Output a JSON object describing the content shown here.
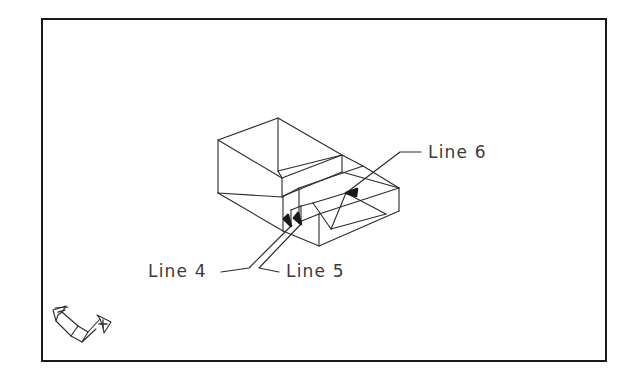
{
  "figure": {
    "background_color": "#ffffff",
    "line_color": "#2b2b2b",
    "text_color": "#3a3a3a",
    "border": {
      "color": "#1a1a1a",
      "thickness_px": 2,
      "x": 41,
      "y": 18,
      "width": 566,
      "height": 344
    }
  },
  "callouts": [
    {
      "id": "line-4",
      "label": "Line 4",
      "text_x": 148,
      "text_y": 277,
      "leader": "M 221 272 L 248 268 L 291 226",
      "arrow_tip_x": 291,
      "arrow_tip_y": 226
    },
    {
      "id": "line-5",
      "label": "Line 5",
      "text_x": 286,
      "text_y": 277,
      "leader": "M 279 272 L 258 268 L 301 224",
      "arrow_tip_x": 301,
      "arrow_tip_y": 224
    },
    {
      "id": "line-6",
      "label": "Line 6",
      "text_x": 428,
      "text_y": 158,
      "leader": "M 421 152 L 399 152 L 346 193",
      "arrow_tip_x": 346,
      "arrow_tip_y": 193
    }
  ],
  "axis_indicator": {
    "name": "coordinate-axis-indicator",
    "x": 55,
    "y": 305,
    "width": 58,
    "height": 42,
    "axes": [
      {
        "id": "axis-left",
        "marker": "minus"
      },
      {
        "id": "axis-right",
        "marker": "plus"
      }
    ]
  },
  "geometry": {
    "description": "Wireframe isometric solid: upper rectangular block with a lower sloped ramp extending to the lower right",
    "edges": [
      "M 218 140 L 278 118 L 342 155 L 282 178 Z",
      "M 218 140 L 218 193",
      "M 278 118 L 278 171",
      "M 342 155 L 342 172",
      "M 282 178 L 282 196",
      "M 218 193 L 282 196",
      "M 218 193 L 282 230",
      "M 282 230 L 298 222",
      "M 282 196 L 298 188",
      "M 278 171 L 282 178",
      "M 298 188 L 362 166 L 398 188 L 398 210",
      "M 362 166 L 342 155",
      "M 298 188 L 298 222",
      "M 362 166 L 398 188",
      "M 298 222 L 318 245 L 398 210",
      "M 318 245 L 318 212",
      "M 318 212 L 398 188",
      "M 298 222 L 318 212",
      "M 312 203 L 345 193 L 385 214",
      "M 312 203 L 330 228",
      "M 330 228 L 385 214",
      "M 345 193 L 330 228",
      "M 282 230 L 318 245",
      "M 296 216 L 312 203",
      "M 296 216 L 296 232"
    ]
  }
}
